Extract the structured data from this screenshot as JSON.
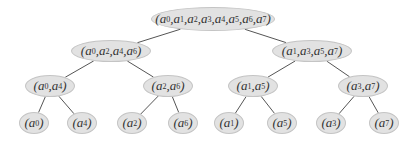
{
  "diagram": {
    "type": "binary-tree",
    "colors": {
      "node_fill": "#e2e2e2",
      "node_border": "#c4c4c4",
      "edge": "#555555",
      "text": "#333333"
    },
    "nodes": [
      {
        "id": "root",
        "label": "(a0,a1,a2,a3,a4,a5,a6,a7)",
        "indices": [
          0,
          1,
          2,
          3,
          4,
          5,
          6,
          7
        ],
        "x": 213,
        "y": 19,
        "w": 124,
        "h": 24
      },
      {
        "id": "n-even",
        "label": "(a0,a2,a4,a6)",
        "indices": [
          0,
          2,
          4,
          6
        ],
        "x": 111,
        "y": 51,
        "w": 80,
        "h": 22
      },
      {
        "id": "n-odd",
        "label": "(a1,a3,a5,a7)",
        "indices": [
          1,
          3,
          5,
          7
        ],
        "x": 312,
        "y": 51,
        "w": 80,
        "h": 22
      },
      {
        "id": "n-04",
        "label": "(a0,a4)",
        "indices": [
          0,
          4
        ],
        "x": 50,
        "y": 86,
        "w": 50,
        "h": 22
      },
      {
        "id": "n-26",
        "label": "(a2,a6)",
        "indices": [
          2,
          6
        ],
        "x": 168,
        "y": 86,
        "w": 50,
        "h": 22
      },
      {
        "id": "n-15",
        "label": "(a1,a5)",
        "indices": [
          1,
          5
        ],
        "x": 253,
        "y": 86,
        "w": 50,
        "h": 22
      },
      {
        "id": "n-37",
        "label": "(a3,a7)",
        "indices": [
          3,
          7
        ],
        "x": 363,
        "y": 86,
        "w": 50,
        "h": 22
      },
      {
        "id": "leaf-0",
        "label": "(a0)",
        "indices": [
          0
        ],
        "x": 34,
        "y": 123,
        "w": 30,
        "h": 22
      },
      {
        "id": "leaf-4",
        "label": "(a4)",
        "indices": [
          4
        ],
        "x": 82,
        "y": 123,
        "w": 30,
        "h": 22
      },
      {
        "id": "leaf-2",
        "label": "(a2)",
        "indices": [
          2
        ],
        "x": 132,
        "y": 123,
        "w": 30,
        "h": 22
      },
      {
        "id": "leaf-6",
        "label": "(a6)",
        "indices": [
          6
        ],
        "x": 183,
        "y": 123,
        "w": 30,
        "h": 22
      },
      {
        "id": "leaf-1",
        "label": "(a1)",
        "indices": [
          1
        ],
        "x": 229,
        "y": 123,
        "w": 30,
        "h": 22
      },
      {
        "id": "leaf-5",
        "label": "(a5)",
        "indices": [
          5
        ],
        "x": 282,
        "y": 123,
        "w": 30,
        "h": 22
      },
      {
        "id": "leaf-3",
        "label": "(a3)",
        "indices": [
          3
        ],
        "x": 331,
        "y": 123,
        "w": 30,
        "h": 22
      },
      {
        "id": "leaf-7",
        "label": "(a7)",
        "indices": [
          7
        ],
        "x": 384,
        "y": 123,
        "w": 30,
        "h": 22
      }
    ],
    "edges": [
      [
        "root",
        "n-even"
      ],
      [
        "root",
        "n-odd"
      ],
      [
        "n-even",
        "n-04"
      ],
      [
        "n-even",
        "n-26"
      ],
      [
        "n-odd",
        "n-15"
      ],
      [
        "n-odd",
        "n-37"
      ],
      [
        "n-04",
        "leaf-0"
      ],
      [
        "n-04",
        "leaf-4"
      ],
      [
        "n-26",
        "leaf-2"
      ],
      [
        "n-26",
        "leaf-6"
      ],
      [
        "n-15",
        "leaf-1"
      ],
      [
        "n-15",
        "leaf-5"
      ],
      [
        "n-37",
        "leaf-3"
      ],
      [
        "n-37",
        "leaf-7"
      ]
    ]
  }
}
